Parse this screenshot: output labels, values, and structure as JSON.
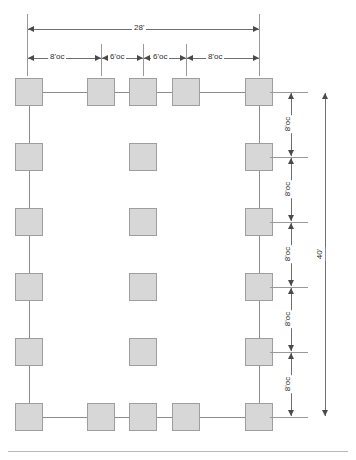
{
  "drawing": {
    "title": "Deck framing plan",
    "overall_width_label": "28'",
    "overall_depth_label": "40'",
    "top_dimensions": [
      {
        "label": "8'oc",
        "x": 27,
        "width": 74
      },
      {
        "label": "6'oc",
        "x": 101,
        "width": 42
      },
      {
        "label": "6'oc",
        "x": 143,
        "width": 43
      },
      {
        "label": "8'oc",
        "x": 186,
        "width": 73
      }
    ],
    "right_dimensions": [
      {
        "label": "8'oc",
        "y": 92,
        "height": 65
      },
      {
        "label": "8'oc",
        "y": 157,
        "height": 65
      },
      {
        "label": "8'oc",
        "y": 222,
        "height": 65
      },
      {
        "label": "8'oc",
        "y": 287,
        "height": 65
      },
      {
        "label": "8'oc",
        "y": 352,
        "height": 65
      }
    ],
    "posts": [
      {
        "name": "post-r1-c1",
        "x": 15,
        "y": 78
      },
      {
        "name": "post-r1-c2",
        "x": 87,
        "y": 78
      },
      {
        "name": "post-r1-c3",
        "x": 129,
        "y": 78
      },
      {
        "name": "post-r1-c4",
        "x": 172,
        "y": 78
      },
      {
        "name": "post-r1-c5",
        "x": 245,
        "y": 78
      },
      {
        "name": "post-r2-c1",
        "x": 15,
        "y": 143
      },
      {
        "name": "post-r2-c3",
        "x": 129,
        "y": 143
      },
      {
        "name": "post-r2-c5",
        "x": 245,
        "y": 143
      },
      {
        "name": "post-r3-c1",
        "x": 15,
        "y": 208
      },
      {
        "name": "post-r3-c3",
        "x": 129,
        "y": 208
      },
      {
        "name": "post-r3-c5",
        "x": 245,
        "y": 208
      },
      {
        "name": "post-r4-c1",
        "x": 15,
        "y": 273
      },
      {
        "name": "post-r4-c3",
        "x": 129,
        "y": 273
      },
      {
        "name": "post-r4-c5",
        "x": 245,
        "y": 273
      },
      {
        "name": "post-r5-c1",
        "x": 15,
        "y": 338
      },
      {
        "name": "post-r5-c3",
        "x": 129,
        "y": 338
      },
      {
        "name": "post-r5-c5",
        "x": 245,
        "y": 338
      },
      {
        "name": "post-r6-c1",
        "x": 15,
        "y": 403
      },
      {
        "name": "post-r6-c2",
        "x": 87,
        "y": 403
      },
      {
        "name": "post-r6-c3",
        "x": 129,
        "y": 403
      },
      {
        "name": "post-r6-c4",
        "x": 172,
        "y": 403
      },
      {
        "name": "post-r6-c5",
        "x": 245,
        "y": 403
      }
    ],
    "post_size": 28,
    "beams": {
      "top_y": 92,
      "bottom_y": 417,
      "left_x": 29,
      "right_x": 259,
      "beam_left_x": 29,
      "beam_right_x": 259
    },
    "colors": {
      "post_fill": "#d7d7d7",
      "post_stroke": "#9e9e9e",
      "beam_line": "#8c8c8c",
      "dimension_line": "#6f6f6f",
      "text": "#2b2b2b",
      "background": "#ffffff"
    }
  }
}
